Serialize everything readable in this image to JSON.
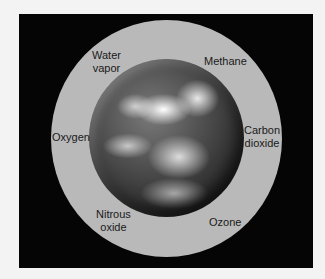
{
  "diagram": {
    "labels": {
      "water_vapor": [
        "Water",
        "vapor"
      ],
      "methane": "Methane",
      "oxygen": "Oxygen",
      "carbon_dioxide": [
        "Carbon",
        "dioxide"
      ],
      "nitrous_oxide": [
        "Nitrous",
        "oxide"
      ],
      "ozone": "Ozone"
    },
    "colors": {
      "background": "#f3f3f3",
      "panel": "#050505",
      "atmosphere": "#b9b9b9",
      "text": "#1a1a1a"
    }
  }
}
